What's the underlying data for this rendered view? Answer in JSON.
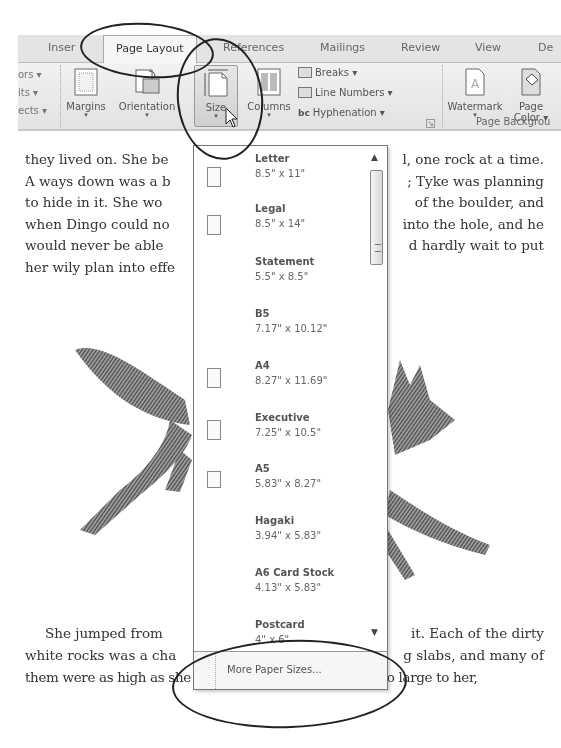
{
  "ribbon": {
    "tabs": [
      {
        "label": "Inser",
        "active": false
      },
      {
        "label": "Page Layout",
        "active": true
      },
      {
        "label": "References",
        "active": false
      },
      {
        "label": "Mailings",
        "active": false
      },
      {
        "label": "Review",
        "active": false
      },
      {
        "label": "View",
        "active": false
      },
      {
        "label": "De",
        "active": false
      }
    ],
    "theme_fragments": [
      "ors ▾",
      "its ▾",
      "ects ▾"
    ],
    "page_setup": {
      "margins": "Margins",
      "orientation": "Orientation",
      "size": "Size",
      "columns": "Columns",
      "breaks": "Breaks ▾",
      "line_numbers": "Line Numbers ▾",
      "hyphenation": "Hyphenation ▾",
      "dropdown_arrow": "▾"
    },
    "page_background": {
      "watermark": "Watermark",
      "page_color_line1": "Page",
      "page_color_line2": "Color ▾",
      "group_label": "Page Backgrou"
    }
  },
  "document": {
    "paragraph1_left": [
      "they lived on.  She be",
      "A ways down was a b",
      "to hide in it.  She wo",
      "when Dingo could no",
      "would never be able",
      "her wily plan into effe"
    ],
    "paragraph1_right": [
      "l, one rock at a time.",
      "; Tyke was planning",
      "of the boulder, and",
      "into the hole, and he",
      "d hardly wait to put"
    ],
    "paragraph2_line1_left": "She jumped from",
    "paragraph2_line1_right": "it.  Each of the dirty",
    "paragraph2_line2_left": "white rocks was a cha",
    "paragraph2_line2_right": "g slabs, and many of",
    "paragraph2_line3": "them were as high as she was tall.  Because they were so large to her,",
    "illustration": "fox-engraving"
  },
  "size_dropdown": {
    "items": [
      {
        "name": "Letter",
        "dims": "8.5\" x 11\"",
        "icon": true
      },
      {
        "name": "Legal",
        "dims": "8.5\" x 14\"",
        "icon": true
      },
      {
        "name": "Statement",
        "dims": "5.5\" x 8.5\"",
        "icon": false
      },
      {
        "name": "B5",
        "dims": "7.17\" x 10.12\"",
        "icon": false
      },
      {
        "name": "A4",
        "dims": "8.27\" x 11.69\"",
        "icon": true
      },
      {
        "name": "Executive",
        "dims": "7.25\" x 10.5\"",
        "icon": true
      },
      {
        "name": "A5",
        "dims": "5.83\" x 8.27\"",
        "icon": true
      },
      {
        "name": "Hagaki",
        "dims": "3.94\" x 5.83\"",
        "icon": false
      },
      {
        "name": "A6 Card Stock",
        "dims": "4.13\" x 5.83\"",
        "icon": false
      },
      {
        "name": "Postcard",
        "dims": "4\" x 6\"",
        "icon": false
      }
    ],
    "scroll_up": "▲",
    "scroll_down": "▼",
    "more_label": "More Paper Sizes..."
  }
}
